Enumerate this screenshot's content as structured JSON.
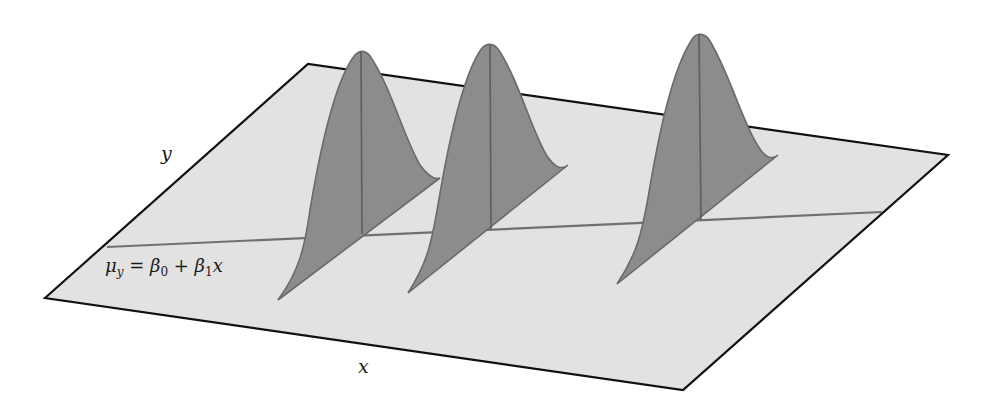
{
  "figure": {
    "axis_labels": {
      "y": "y",
      "x": "x"
    },
    "equation": {
      "mu": "μ",
      "mu_sub": "y",
      "equals": " = ",
      "beta0": "β",
      "beta0_sub": "0",
      "plus": " + ",
      "beta1": "β",
      "beta1_sub": "1",
      "x": "x"
    },
    "colors": {
      "plane_fill": "#e2e2e2",
      "plane_border": "#111111",
      "curve_fill": "#8c8c8c",
      "curve_stroke": "#6a6a6a",
      "regression_line": "#707070"
    },
    "distributions": [
      {
        "name": "distribution-1"
      },
      {
        "name": "distribution-2"
      },
      {
        "name": "distribution-3"
      }
    ]
  }
}
